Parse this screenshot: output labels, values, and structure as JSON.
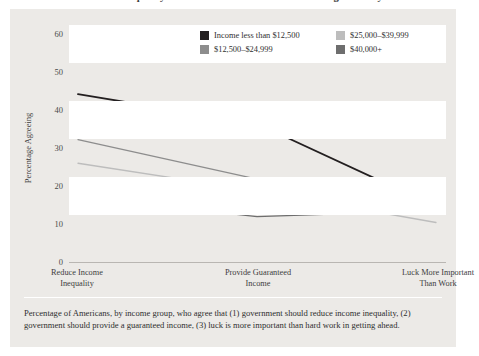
{
  "figure": {
    "title_partial": "Income Inequality and Beliefs about Fairness in the Larger Society",
    "caption": "Percentage of Americans, by income group, who agree that (1) government should reduce income inequality, (2) government should provide a guaranteed income, (3) luck is more important than hard work in getting ahead."
  },
  "legend": {
    "items": [
      {
        "label": "Income less than $12,500",
        "color": "#231f20"
      },
      {
        "label": "$25,000–$39,999",
        "color": "#bdbdbd"
      },
      {
        "label": "$12,500–$24,999",
        "color": "#8d8d8d"
      },
      {
        "label": "$40,000+",
        "color": "#6e6e6e"
      }
    ]
  },
  "chart_data": {
    "type": "line",
    "title": "Income Inequality and Beliefs about Fairness in the Larger Society",
    "xlabel": "",
    "ylabel": "Percentage Agreeing",
    "categories": [
      "Reduce Income Inequality",
      "Provide Guaranteed Income",
      "Luck More Important Than Work"
    ],
    "category_lines": [
      [
        "Reduce Income",
        "Inequality"
      ],
      [
        "Provide Guaranteed",
        "Income"
      ],
      [
        "Luck More Important",
        "Than Work"
      ]
    ],
    "ylim": [
      0,
      60
    ],
    "yticks": [
      0,
      10,
      20,
      30,
      40,
      50,
      60
    ],
    "grid": "horizontal-bands",
    "legend_position": "top-right",
    "series": [
      {
        "name": "Income less than $12,500",
        "color": "#231f20",
        "values": [
          42.5,
          35.0,
          14.0
        ]
      },
      {
        "name": "$12,500–$24,999",
        "color": "#8d8d8d",
        "values": [
          31.0,
          21.0,
          13.5
        ]
      },
      {
        "name": "$25,000–$39,999",
        "color": "#bdbdbd",
        "values": [
          25.0,
          18.0,
          10.0
        ]
      },
      {
        "name": "$40,000+",
        "color": "#6e6e6e",
        "values": [
          16.5,
          11.5,
          13.0
        ]
      }
    ]
  }
}
